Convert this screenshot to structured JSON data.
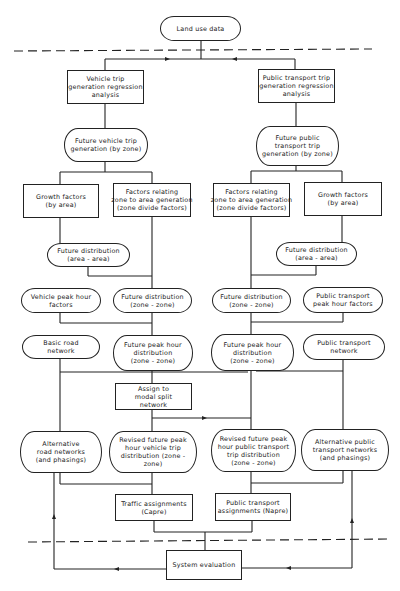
{
  "diagram": {
    "type": "flowchart",
    "colors": {
      "line": "#222222",
      "background": "#ffffff",
      "text": "#1a1a1a"
    },
    "nodes": {
      "land_use": {
        "lines": [
          "Land use data"
        ]
      },
      "veh_gen_reg": {
        "lines": [
          "Vehicle trip",
          "generation regression",
          "analysis"
        ]
      },
      "pt_gen_reg": {
        "lines": [
          "Public transport trip",
          "generation regression",
          "analysis"
        ]
      },
      "veh_future_gen": {
        "lines": [
          "Future vehicle trip",
          "generation (by zone)"
        ]
      },
      "pt_future_gen": {
        "lines": [
          "Future public",
          "transport trip",
          "generation (by zone)"
        ]
      },
      "veh_growth": {
        "lines": [
          "Growth factors",
          "(by area)"
        ]
      },
      "veh_factors": {
        "lines": [
          "Factors relating",
          "zone to area generation",
          "(zone divide factors)"
        ]
      },
      "pt_factors": {
        "lines": [
          "Factors relating",
          "zone to area generation",
          "(zone divide factors)"
        ]
      },
      "pt_growth": {
        "lines": [
          "Growth factors",
          "(by area)"
        ]
      },
      "veh_dist_area": {
        "lines": [
          "Future distribution",
          "(area - area)"
        ]
      },
      "pt_dist_area": {
        "lines": [
          "Future distribution",
          "(area - area)"
        ]
      },
      "veh_peak_factors": {
        "lines": [
          "Vehicle peak hour",
          "factors"
        ]
      },
      "veh_dist_zone": {
        "lines": [
          "Future distribution",
          "(zone - zone)"
        ]
      },
      "pt_dist_zone": {
        "lines": [
          "Future distribution",
          "(zone - zone)"
        ]
      },
      "pt_peak_factors": {
        "lines": [
          "Public transport",
          "peak hour factors"
        ]
      },
      "basic_road": {
        "lines": [
          "Basic road",
          "network"
        ]
      },
      "veh_peak_dist": {
        "lines": [
          "Future peak hour",
          "distribution",
          "(zone - zone)"
        ]
      },
      "pt_peak_dist": {
        "lines": [
          "Future peak hour",
          "distribution",
          "(zone - zone)"
        ]
      },
      "pt_network": {
        "lines": [
          "Public transport",
          "network"
        ]
      },
      "modal_split": {
        "lines": [
          "Assign to",
          "modal split",
          "network"
        ]
      },
      "alt_road": {
        "lines": [
          "Alternative",
          "road networks",
          "(and phasings)"
        ]
      },
      "veh_revised": {
        "lines": [
          "Revised future peak",
          "hour vehicle trip",
          "distribution (zone -",
          "zone)"
        ]
      },
      "pt_revised": {
        "lines": [
          "Revised future peak",
          "hour public transport",
          "trip distribution",
          "(zone - zone)"
        ]
      },
      "alt_pt": {
        "lines": [
          "Alternative public",
          "transport networks",
          "(and phasings)"
        ]
      },
      "traffic_assign": {
        "lines": [
          "Traffic assignments",
          "(Capre)"
        ]
      },
      "pt_assign": {
        "lines": [
          "Public transport",
          "assignments (Napre)"
        ]
      },
      "system_eval": {
        "lines": [
          "System evaluation"
        ]
      }
    }
  }
}
